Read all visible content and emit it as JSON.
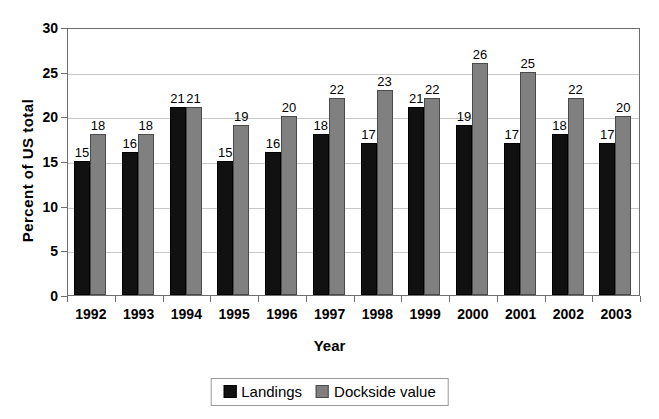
{
  "chart_data": {
    "type": "bar",
    "title": "",
    "xlabel": "Year",
    "ylabel": "Percent of US  total",
    "ylim": [
      0,
      30
    ],
    "yticks": [
      0,
      5,
      10,
      15,
      20,
      25,
      30
    ],
    "grid": true,
    "legend_position": "bottom",
    "categories": [
      "1992",
      "1993",
      "1994",
      "1995",
      "1996",
      "1997",
      "1998",
      "1999",
      "2000",
      "2001",
      "2002",
      "2003"
    ],
    "series": [
      {
        "name": "Landings",
        "color": "#111111",
        "values": [
          15,
          16,
          21,
          15,
          16,
          18,
          17,
          21,
          19,
          17,
          18,
          17
        ]
      },
      {
        "name": "Dockside value",
        "color": "#808080",
        "values": [
          18,
          18,
          21,
          19,
          20,
          22,
          23,
          22,
          26,
          25,
          22,
          20
        ]
      }
    ]
  },
  "colors": {
    "landings": "#111111",
    "dockside": "#808080",
    "gridline": "#c8c8c8",
    "axis": "#6e6e6e"
  }
}
